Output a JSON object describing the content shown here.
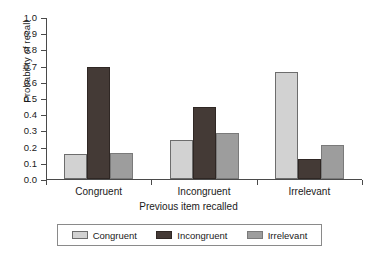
{
  "chart_data": {
    "type": "bar",
    "title": "",
    "subtitle": "",
    "xlabel": "Previous item recalled",
    "ylabel": "Probability of recall",
    "categories": [
      "Congruent",
      "Incongruent",
      "Irrelevant"
    ],
    "series": [
      {
        "name": "Congruent",
        "color": "#d2d2d2",
        "values": [
          0.15,
          0.24,
          0.66
        ]
      },
      {
        "name": "Incongruent",
        "color": "#443a36",
        "values": [
          0.69,
          0.44,
          0.12
        ]
      },
      {
        "name": "Irrelevant",
        "color": "#9d9d9d",
        "values": [
          0.16,
          0.28,
          0.21
        ]
      }
    ],
    "ylim": [
      0.0,
      1.0
    ],
    "ytick_labels": [
      "1.0",
      "0.9",
      "0.8",
      "0.7",
      "0.6",
      "0.5",
      "0.4",
      "0.3",
      "0.2",
      "0.1",
      "0.0"
    ],
    "ytick_values": [
      1.0,
      0.9,
      0.8,
      0.7,
      0.6,
      0.5,
      0.4,
      0.3,
      0.2,
      0.1,
      0.0
    ],
    "grid": false,
    "legend_position": "below-center",
    "legend_entries": [
      "Congruent",
      "Incongruent",
      "Irrelevant"
    ]
  }
}
